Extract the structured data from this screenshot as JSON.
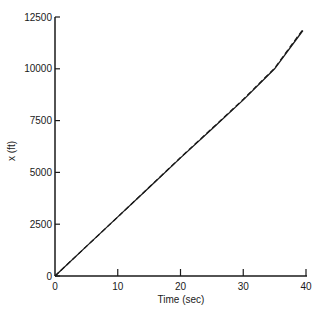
{
  "chart_data": {
    "type": "line",
    "title": "",
    "xlabel": "Time (sec)",
    "ylabel": "x (ft)",
    "xlim": [
      0,
      40
    ],
    "ylim": [
      0,
      12500
    ],
    "xticks": [
      0,
      10,
      20,
      30,
      40
    ],
    "yticks": [
      0,
      2500,
      5000,
      7500,
      10000,
      12500
    ],
    "grid": false,
    "legend": null,
    "series": [
      {
        "name": "solid",
        "style": "solid",
        "x": [
          0,
          5,
          10,
          15,
          20,
          25,
          30,
          35,
          39.5
        ],
        "values": [
          0,
          1430,
          2850,
          4270,
          5700,
          7100,
          8500,
          10000,
          11850
        ]
      },
      {
        "name": "dashed",
        "style": "dashed",
        "x": [
          0,
          5,
          10,
          15,
          20,
          25,
          30,
          35,
          39.5
        ],
        "values": [
          0,
          1430,
          2850,
          4280,
          5720,
          7120,
          8530,
          10030,
          11900
        ]
      }
    ]
  },
  "labels": {
    "xlabel": "Time (sec)",
    "ylabel": "x (ft)",
    "xticks": [
      "0",
      "10",
      "20",
      "30",
      "40"
    ],
    "yticks": [
      "0",
      "2500",
      "5000",
      "7500",
      "10000",
      "12500"
    ]
  }
}
